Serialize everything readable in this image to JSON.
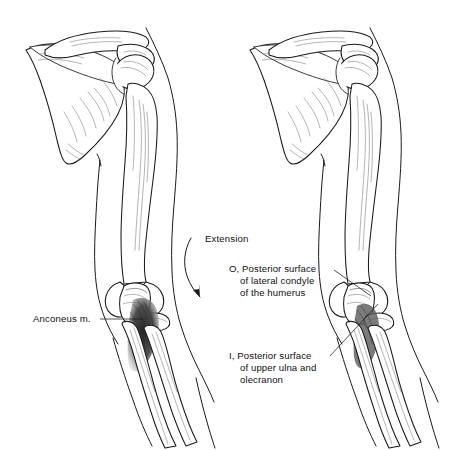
{
  "figure": {
    "background_color": "#ffffff",
    "ink_color": "#1a1a1a",
    "panels": [
      {
        "id": "left-panel",
        "name": "anconeus-muscle-panel",
        "description": "Left figure showing anconeus muscle in place with extension movement arrow"
      },
      {
        "id": "right-panel",
        "name": "attachment-sites-panel",
        "description": "Right figure showing origin and insertion attachment sites"
      }
    ]
  },
  "labels": {
    "extension": {
      "text": "Extension",
      "x": 205,
      "y": 242
    },
    "anconeus": {
      "text": "Anconeus m.",
      "x": 33,
      "y": 322
    },
    "origin": {
      "marker": "O,",
      "lines": [
        "O, Posterior surface",
        "of lateral condyle",
        "of the humerus"
      ],
      "x": 229,
      "y": 272
    },
    "insertion": {
      "marker": "I,",
      "lines": [
        "I, Posterior surface",
        "of upper ulna and",
        "olecranon"
      ],
      "x": 229,
      "y": 359
    }
  },
  "anatomy": {
    "structures": [
      "clavicle",
      "scapula",
      "spine-of-scapula",
      "acromion",
      "humeral-head",
      "humerus-shaft",
      "lateral-condyle",
      "olecranon",
      "ulna",
      "radius",
      "arm-skin-contour"
    ]
  }
}
